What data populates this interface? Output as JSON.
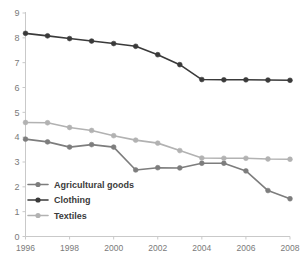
{
  "chart_data": {
    "type": "line",
    "title": "",
    "xlabel": "",
    "ylabel": "",
    "x": [
      1996,
      1997,
      1998,
      1999,
      2000,
      2001,
      2002,
      2003,
      2004,
      2005,
      2006,
      2007,
      2008
    ],
    "xlim": [
      1996,
      2008
    ],
    "ylim": [
      0,
      9
    ],
    "xtick_labels": [
      "1996",
      "1998",
      "2000",
      "2002",
      "2004",
      "2006",
      "2008"
    ],
    "xticks": [
      1996,
      1998,
      2000,
      2002,
      2004,
      2006,
      2008
    ],
    "ytick_labels": [
      "0",
      "1",
      "2",
      "3",
      "4",
      "5",
      "6",
      "7",
      "8",
      "9"
    ],
    "yticks": [
      0,
      1,
      2,
      3,
      4,
      5,
      6,
      7,
      8,
      9
    ],
    "grid": false,
    "legend_position": "lower-left",
    "markers": "circle",
    "series": [
      {
        "name": "Agricultural goods",
        "color": "#7d7d7d",
        "values": [
          3.92,
          3.81,
          3.6,
          3.7,
          3.6,
          2.68,
          2.77,
          2.76,
          2.95,
          2.95,
          2.64,
          1.85,
          1.52
        ]
      },
      {
        "name": "Clothing",
        "color": "#3a3a3a",
        "values": [
          8.18,
          8.08,
          7.97,
          7.87,
          7.77,
          7.66,
          7.32,
          6.92,
          6.32,
          6.31,
          6.31,
          6.3,
          6.29
        ]
      },
      {
        "name": "Textiles",
        "color": "#b2b2b2",
        "values": [
          4.59,
          4.58,
          4.39,
          4.27,
          4.06,
          3.88,
          3.76,
          3.46,
          3.16,
          3.15,
          3.15,
          3.12,
          3.11
        ]
      }
    ]
  },
  "legend": {
    "items": [
      {
        "label": "Agricultural goods",
        "color": "#7d7d7d"
      },
      {
        "label": "Clothing",
        "color": "#3a3a3a"
      },
      {
        "label": "Textiles",
        "color": "#b2b2b2"
      }
    ]
  },
  "axis": {
    "line_color": "#c9c9c9",
    "tick_color": "#7a7a7a"
  }
}
